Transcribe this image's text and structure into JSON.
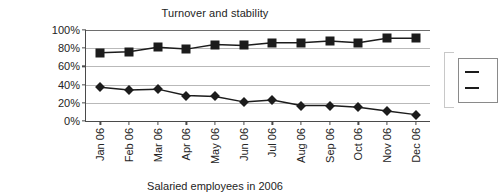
{
  "chart_data": {
    "type": "line",
    "title": "Turnover and stability",
    "caption": "Salaried employees in 2006",
    "xlabel": "",
    "ylabel": "",
    "ylim": [
      0,
      100
    ],
    "yticks": [
      "0%",
      "20%",
      "40%",
      "60%",
      "80%",
      "100%"
    ],
    "ytick_values": [
      0,
      20,
      40,
      60,
      80,
      100
    ],
    "grid": true,
    "legend_position": "right",
    "categories": [
      "Jan 06",
      "Feb 06",
      "Mar 06",
      "Apr 06",
      "May 06",
      "Jun 06",
      "Jul 06",
      "Aug 06",
      "Sep 06",
      "Oct 06",
      "Nov 06",
      "Dec 06"
    ],
    "series": [
      {
        "name": "stability",
        "marker": "square",
        "color": "#1c1c1c",
        "values": [
          75,
          76,
          81,
          79,
          84,
          83,
          86,
          86,
          88,
          86,
          91,
          91
        ]
      },
      {
        "name": "turnover",
        "marker": "diamond",
        "color": "#1c1c1c",
        "values": [
          37,
          34,
          35,
          28,
          27,
          21,
          23,
          17,
          17,
          15,
          11,
          7
        ]
      }
    ],
    "legend_entries": [
      "",
      ""
    ]
  },
  "colors": {
    "axis": "#4a4a4a",
    "grid": "#b9b9b9",
    "series": "#1c1c1c",
    "text": "#242424",
    "background": "#ffffff"
  }
}
